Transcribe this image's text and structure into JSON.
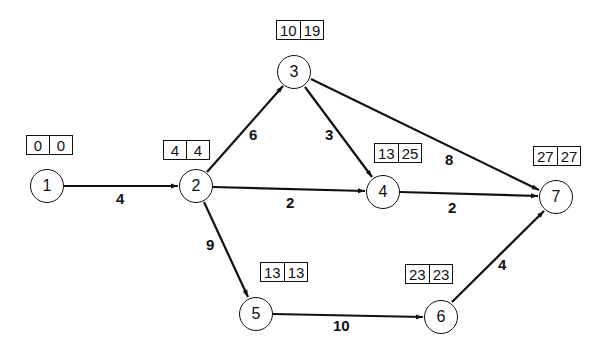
{
  "diagram": {
    "type": "activity-on-arrow network (critical path)",
    "nodes": [
      {
        "id": "1",
        "label": "1",
        "early": "0",
        "late": "0"
      },
      {
        "id": "2",
        "label": "2",
        "early": "4",
        "late": "4"
      },
      {
        "id": "3",
        "label": "3",
        "early": "10",
        "late": "19"
      },
      {
        "id": "4",
        "label": "4",
        "early": "13",
        "late": "25"
      },
      {
        "id": "5",
        "label": "5",
        "early": "13",
        "late": "13"
      },
      {
        "id": "6",
        "label": "6",
        "early": "23",
        "late": "23"
      },
      {
        "id": "7",
        "label": "7",
        "early": "27",
        "late": "27"
      }
    ],
    "edges": [
      {
        "from": "1",
        "to": "2",
        "duration": "4"
      },
      {
        "from": "2",
        "to": "3",
        "duration": "6"
      },
      {
        "from": "2",
        "to": "4",
        "duration": "2"
      },
      {
        "from": "2",
        "to": "5",
        "duration": "9"
      },
      {
        "from": "3",
        "to": "4",
        "duration": "3"
      },
      {
        "from": "3",
        "to": "7",
        "duration": "8"
      },
      {
        "from": "4",
        "to": "7",
        "duration": "2"
      },
      {
        "from": "5",
        "to": "6",
        "duration": "10"
      },
      {
        "from": "6",
        "to": "7",
        "duration": "4"
      }
    ]
  }
}
